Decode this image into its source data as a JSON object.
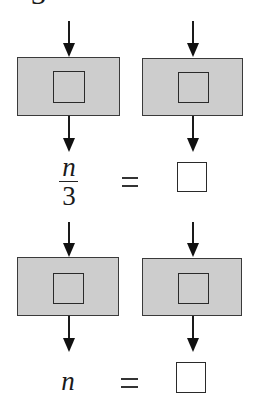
{
  "diagram": {
    "type": "function-machine",
    "top_fragment": "3",
    "rows": [
      {
        "machines": [
          {
            "id": "machine-1a",
            "operation": ""
          },
          {
            "id": "machine-1b",
            "operation": ""
          }
        ],
        "output_left": {
          "numerator": "n",
          "denominator": "3"
        },
        "equals": "=",
        "output_right": ""
      },
      {
        "machines": [
          {
            "id": "machine-2a",
            "operation": ""
          },
          {
            "id": "machine-2b",
            "operation": ""
          }
        ],
        "output_left": "n",
        "equals": "=",
        "output_right": ""
      }
    ],
    "colors": {
      "machine_fill": "#cdcdcd",
      "stroke": "#2a2a2a",
      "background": "#ffffff"
    }
  }
}
